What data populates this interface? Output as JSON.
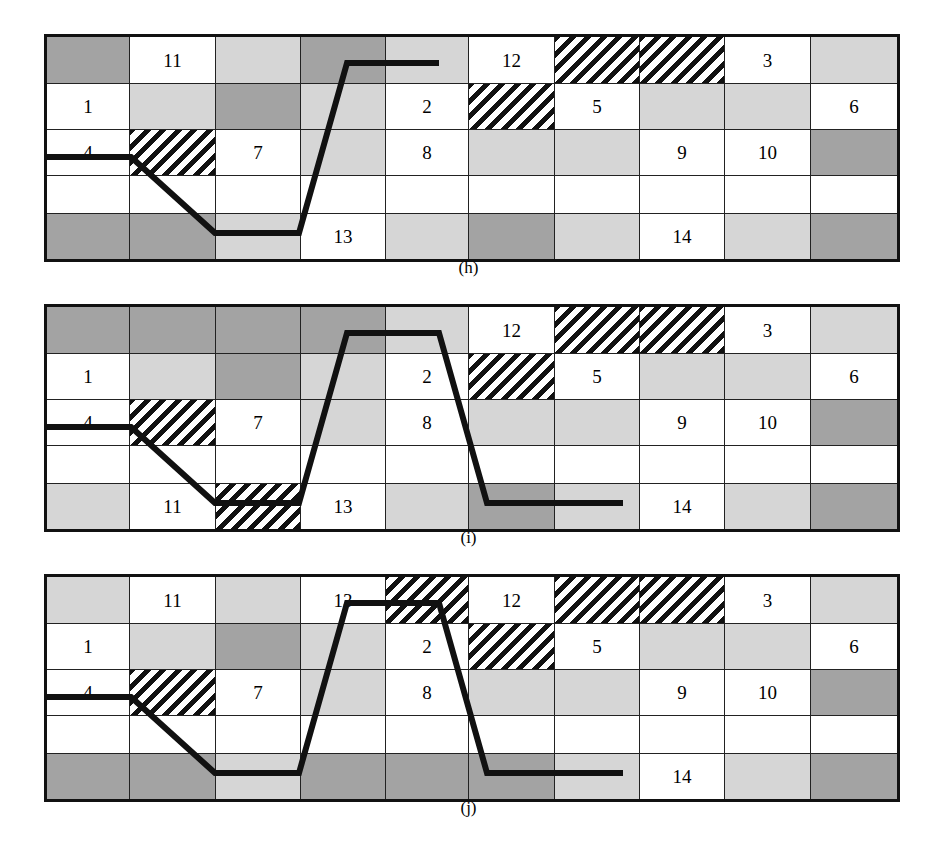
{
  "figure": {
    "title": "",
    "panel_count": 3,
    "grid": {
      "cols": 10,
      "rows": 5
    },
    "colors": {
      "white": "#ffffff",
      "light_gray": "#d6d6d6",
      "dark_gray": "#a3a3a3",
      "hatch_line": "#111111",
      "border": "#111111",
      "path_line": "#111111"
    }
  },
  "panels": [
    {
      "id": "h",
      "caption": "(h)",
      "cells": [
        [
          {
            "fill": "dark",
            "label": ""
          },
          {
            "fill": "white",
            "label": "11"
          },
          {
            "fill": "light",
            "label": ""
          },
          {
            "fill": "dark",
            "label": ""
          },
          {
            "fill": "light",
            "label": ""
          },
          {
            "fill": "white",
            "label": "12"
          },
          {
            "fill": "hatch",
            "label": ""
          },
          {
            "fill": "hatch",
            "label": ""
          },
          {
            "fill": "white",
            "label": "3"
          },
          {
            "fill": "light",
            "label": ""
          }
        ],
        [
          {
            "fill": "white",
            "label": "1"
          },
          {
            "fill": "light",
            "label": ""
          },
          {
            "fill": "dark",
            "label": ""
          },
          {
            "fill": "light",
            "label": ""
          },
          {
            "fill": "white",
            "label": "2"
          },
          {
            "fill": "hatch",
            "label": ""
          },
          {
            "fill": "white",
            "label": "5"
          },
          {
            "fill": "light",
            "label": ""
          },
          {
            "fill": "light",
            "label": ""
          },
          {
            "fill": "white",
            "label": "6"
          }
        ],
        [
          {
            "fill": "white",
            "label": "4"
          },
          {
            "fill": "hatch",
            "label": ""
          },
          {
            "fill": "white",
            "label": "7"
          },
          {
            "fill": "light",
            "label": ""
          },
          {
            "fill": "white",
            "label": "8"
          },
          {
            "fill": "light",
            "label": ""
          },
          {
            "fill": "light",
            "label": ""
          },
          {
            "fill": "white",
            "label": "9"
          },
          {
            "fill": "white",
            "label": "10"
          },
          {
            "fill": "dark",
            "label": ""
          }
        ],
        [
          {
            "fill": "white",
            "label": ""
          },
          {
            "fill": "white",
            "label": ""
          },
          {
            "fill": "white",
            "label": ""
          },
          {
            "fill": "white",
            "label": ""
          },
          {
            "fill": "white",
            "label": ""
          },
          {
            "fill": "white",
            "label": ""
          },
          {
            "fill": "white",
            "label": ""
          },
          {
            "fill": "white",
            "label": ""
          },
          {
            "fill": "white",
            "label": ""
          },
          {
            "fill": "white",
            "label": ""
          }
        ],
        [
          {
            "fill": "dark",
            "label": ""
          },
          {
            "fill": "dark",
            "label": ""
          },
          {
            "fill": "light",
            "label": ""
          },
          {
            "fill": "white",
            "label": "13"
          },
          {
            "fill": "light",
            "label": ""
          },
          {
            "fill": "dark",
            "label": ""
          },
          {
            "fill": "light",
            "label": ""
          },
          {
            "fill": "white",
            "label": "14"
          },
          {
            "fill": "light",
            "label": ""
          },
          {
            "fill": "dark",
            "label": ""
          }
        ]
      ],
      "path": "0,120 84,120 168,196 252,196 300,26 392,26"
    },
    {
      "id": "i",
      "caption": "(i)",
      "cells": [
        [
          {
            "fill": "dark",
            "label": ""
          },
          {
            "fill": "dark",
            "label": ""
          },
          {
            "fill": "dark",
            "label": ""
          },
          {
            "fill": "dark",
            "label": ""
          },
          {
            "fill": "light",
            "label": ""
          },
          {
            "fill": "white",
            "label": "12"
          },
          {
            "fill": "hatch",
            "label": ""
          },
          {
            "fill": "hatch",
            "label": ""
          },
          {
            "fill": "white",
            "label": "3"
          },
          {
            "fill": "light",
            "label": ""
          }
        ],
        [
          {
            "fill": "white",
            "label": "1"
          },
          {
            "fill": "light",
            "label": ""
          },
          {
            "fill": "dark",
            "label": ""
          },
          {
            "fill": "light",
            "label": ""
          },
          {
            "fill": "white",
            "label": "2"
          },
          {
            "fill": "hatch",
            "label": ""
          },
          {
            "fill": "white",
            "label": "5"
          },
          {
            "fill": "light",
            "label": ""
          },
          {
            "fill": "light",
            "label": ""
          },
          {
            "fill": "white",
            "label": "6"
          }
        ],
        [
          {
            "fill": "white",
            "label": "4"
          },
          {
            "fill": "hatch",
            "label": ""
          },
          {
            "fill": "white",
            "label": "7"
          },
          {
            "fill": "light",
            "label": ""
          },
          {
            "fill": "white",
            "label": "8"
          },
          {
            "fill": "light",
            "label": ""
          },
          {
            "fill": "light",
            "label": ""
          },
          {
            "fill": "white",
            "label": "9"
          },
          {
            "fill": "white",
            "label": "10"
          },
          {
            "fill": "dark",
            "label": ""
          }
        ],
        [
          {
            "fill": "white",
            "label": ""
          },
          {
            "fill": "white",
            "label": ""
          },
          {
            "fill": "white",
            "label": ""
          },
          {
            "fill": "white",
            "label": ""
          },
          {
            "fill": "white",
            "label": ""
          },
          {
            "fill": "white",
            "label": ""
          },
          {
            "fill": "white",
            "label": ""
          },
          {
            "fill": "white",
            "label": ""
          },
          {
            "fill": "white",
            "label": ""
          },
          {
            "fill": "white",
            "label": ""
          }
        ],
        [
          {
            "fill": "light",
            "label": ""
          },
          {
            "fill": "white",
            "label": "11"
          },
          {
            "fill": "hatch",
            "label": ""
          },
          {
            "fill": "white",
            "label": "13"
          },
          {
            "fill": "light",
            "label": ""
          },
          {
            "fill": "dark",
            "label": ""
          },
          {
            "fill": "light",
            "label": ""
          },
          {
            "fill": "white",
            "label": "14"
          },
          {
            "fill": "light",
            "label": ""
          },
          {
            "fill": "dark",
            "label": ""
          }
        ]
      ],
      "path": "0,120 84,120 168,196 252,196 300,26 392,26 440,196 576,196"
    },
    {
      "id": "j",
      "caption": "(j)",
      "cells": [
        [
          {
            "fill": "light",
            "label": ""
          },
          {
            "fill": "white",
            "label": "11"
          },
          {
            "fill": "light",
            "label": ""
          },
          {
            "fill": "white",
            "label": "13"
          },
          {
            "fill": "hatch",
            "label": ""
          },
          {
            "fill": "white",
            "label": "12"
          },
          {
            "fill": "hatch",
            "label": ""
          },
          {
            "fill": "hatch",
            "label": ""
          },
          {
            "fill": "white",
            "label": "3"
          },
          {
            "fill": "light",
            "label": ""
          }
        ],
        [
          {
            "fill": "white",
            "label": "1"
          },
          {
            "fill": "light",
            "label": ""
          },
          {
            "fill": "dark",
            "label": ""
          },
          {
            "fill": "light",
            "label": ""
          },
          {
            "fill": "white",
            "label": "2"
          },
          {
            "fill": "hatch",
            "label": ""
          },
          {
            "fill": "white",
            "label": "5"
          },
          {
            "fill": "light",
            "label": ""
          },
          {
            "fill": "light",
            "label": ""
          },
          {
            "fill": "white",
            "label": "6"
          }
        ],
        [
          {
            "fill": "white",
            "label": "4"
          },
          {
            "fill": "hatch",
            "label": ""
          },
          {
            "fill": "white",
            "label": "7"
          },
          {
            "fill": "light",
            "label": ""
          },
          {
            "fill": "white",
            "label": "8"
          },
          {
            "fill": "light",
            "label": ""
          },
          {
            "fill": "light",
            "label": ""
          },
          {
            "fill": "white",
            "label": "9"
          },
          {
            "fill": "white",
            "label": "10"
          },
          {
            "fill": "dark",
            "label": ""
          }
        ],
        [
          {
            "fill": "white",
            "label": ""
          },
          {
            "fill": "white",
            "label": ""
          },
          {
            "fill": "white",
            "label": ""
          },
          {
            "fill": "white",
            "label": ""
          },
          {
            "fill": "white",
            "label": ""
          },
          {
            "fill": "white",
            "label": ""
          },
          {
            "fill": "white",
            "label": ""
          },
          {
            "fill": "white",
            "label": ""
          },
          {
            "fill": "white",
            "label": ""
          },
          {
            "fill": "white",
            "label": ""
          }
        ],
        [
          {
            "fill": "dark",
            "label": ""
          },
          {
            "fill": "dark",
            "label": ""
          },
          {
            "fill": "light",
            "label": ""
          },
          {
            "fill": "dark",
            "label": ""
          },
          {
            "fill": "dark",
            "label": ""
          },
          {
            "fill": "dark",
            "label": ""
          },
          {
            "fill": "light",
            "label": ""
          },
          {
            "fill": "white",
            "label": "14"
          },
          {
            "fill": "light",
            "label": ""
          },
          {
            "fill": "dark",
            "label": ""
          }
        ]
      ],
      "path": "0,120 84,120 168,196 252,196 300,26 392,26 440,196 576,196"
    }
  ]
}
